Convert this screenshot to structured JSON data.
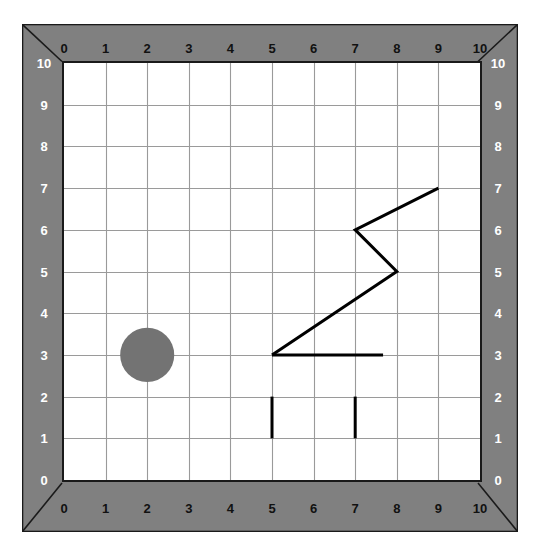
{
  "board": {
    "title": "coordinate-grid-board",
    "frame_color": "#808080",
    "frame_edge_color": "#1a1a1a",
    "plot_background": "#ffffff",
    "plot_border_color": "#1a1a1a",
    "grid_color": "#9a9a9a",
    "ink_color": "#000000",
    "shape_fill": "#737373",
    "top_label_color": "#111111",
    "bottom_label_color": "#111111",
    "left_label_color": "#ffffff",
    "right_label_color": "#ffffff"
  },
  "axes": {
    "x_min": 0,
    "x_max": 10,
    "y_min": 0,
    "y_max": 10,
    "top_ticks": [
      "0",
      "1",
      "2",
      "3",
      "4",
      "5",
      "6",
      "7",
      "8",
      "9",
      "10"
    ],
    "bottom_ticks": [
      "0",
      "1",
      "2",
      "3",
      "4",
      "5",
      "6",
      "7",
      "8",
      "9",
      "10"
    ],
    "left_ticks": [
      "10",
      "9",
      "8",
      "7",
      "6",
      "5",
      "4",
      "3",
      "2",
      "1",
      "0"
    ],
    "right_ticks": [
      "10",
      "9",
      "8",
      "7",
      "6",
      "5",
      "4",
      "3",
      "2",
      "1",
      "0"
    ]
  },
  "chart_data": {
    "type": "scatter",
    "title": "",
    "xlabel": "",
    "ylabel": "",
    "xlim": [
      0,
      10
    ],
    "ylim": [
      0,
      10
    ],
    "grid": true,
    "legend": "none",
    "shapes": [
      {
        "name": "circle",
        "kind": "circle",
        "center": [
          2,
          3
        ],
        "radius_units": 0.65,
        "fill": "#737373",
        "stroke": "none"
      },
      {
        "name": "zigzag-polyline",
        "kind": "polyline",
        "points": [
          [
            5,
            3
          ],
          [
            8,
            5
          ],
          [
            7,
            6
          ],
          [
            9,
            7
          ]
        ],
        "stroke": "#000000",
        "stroke_width_px": 3,
        "fill": "none"
      },
      {
        "name": "horizontal-segment",
        "kind": "polyline",
        "points": [
          [
            5,
            3
          ],
          [
            7.67,
            3
          ]
        ],
        "stroke": "#000000",
        "stroke_width_px": 3,
        "fill": "none"
      },
      {
        "name": "vertical-bar-left",
        "kind": "polyline",
        "points": [
          [
            5,
            1
          ],
          [
            5,
            2
          ]
        ],
        "stroke": "#000000",
        "stroke_width_px": 3,
        "fill": "none"
      },
      {
        "name": "vertical-bar-right",
        "kind": "polyline",
        "points": [
          [
            7,
            1
          ],
          [
            7,
            2
          ]
        ],
        "stroke": "#000000",
        "stroke_width_px": 3,
        "fill": "none"
      }
    ]
  }
}
